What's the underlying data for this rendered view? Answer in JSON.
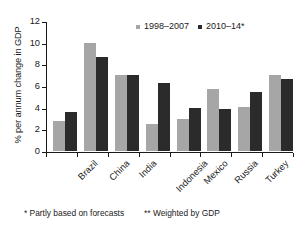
{
  "chart_data": {
    "type": "bar",
    "title": "",
    "xlabel": "",
    "ylabel": "% per annum change in GDP",
    "ylim": [
      0,
      12
    ],
    "yticks": [
      0,
      2,
      4,
      6,
      8,
      10,
      12
    ],
    "grid": false,
    "legend_position": "top-center",
    "categories": [
      "Brazil",
      "China",
      "India",
      "Indonesia",
      "Mexico",
      "Russia",
      "Turkey",
      "Average**"
    ],
    "series": [
      {
        "name": "1998–2007",
        "color": "#a6a6a6",
        "values": [
          2.8,
          10.0,
          7.0,
          2.5,
          3.0,
          5.75,
          4.1,
          7.0
        ]
      },
      {
        "name": "2010–14*",
        "color": "#2b2b2b",
        "values": [
          3.6,
          8.7,
          7.0,
          6.3,
          4.0,
          3.9,
          5.45,
          6.65
        ]
      }
    ]
  },
  "legend": {
    "items": [
      {
        "label": "1998–2007",
        "color": "#a6a6a6"
      },
      {
        "label": "2010–14*",
        "color": "#2b2b2b"
      }
    ]
  },
  "footnotes": [
    "* Partly based on forecasts",
    "** Weighted  by GDP"
  ]
}
